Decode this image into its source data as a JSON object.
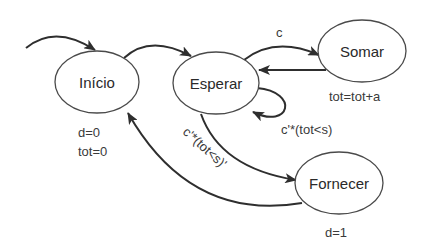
{
  "diagram": {
    "type": "finite-state-machine",
    "states": [
      {
        "id": "inicio",
        "label": "Início",
        "actions": [
          "d=0",
          "tot=0"
        ]
      },
      {
        "id": "esperar",
        "label": "Esperar",
        "actions": []
      },
      {
        "id": "somar",
        "label": "Somar",
        "actions": [
          "tot=tot+a"
        ]
      },
      {
        "id": "fornecer",
        "label": "Fornecer",
        "actions": [
          "d=1"
        ]
      }
    ],
    "transitions": [
      {
        "from": "",
        "to": "inicio",
        "label": ""
      },
      {
        "from": "inicio",
        "to": "esperar",
        "label": ""
      },
      {
        "from": "esperar",
        "to": "somar",
        "label": "c"
      },
      {
        "from": "somar",
        "to": "esperar",
        "label": ""
      },
      {
        "from": "esperar",
        "to": "esperar",
        "label": "c'*(tot<s)"
      },
      {
        "from": "esperar",
        "to": "fornecer",
        "label": "c'*(tot<s)'"
      },
      {
        "from": "fornecer",
        "to": "inicio",
        "label": ""
      }
    ],
    "colors": {
      "stroke": "#2e2e2e",
      "text": "#2a2a2a",
      "background": "#ffffff"
    }
  }
}
